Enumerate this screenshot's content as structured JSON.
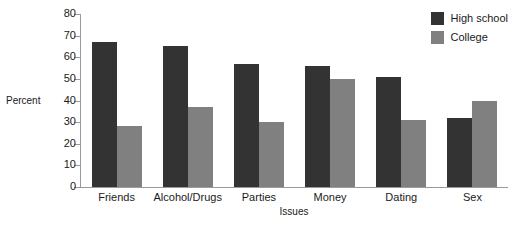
{
  "chart_data": {
    "type": "bar",
    "title": "",
    "xlabel": "Issues",
    "ylabel": "Percent",
    "categories": [
      "Friends",
      "Alcohol/Drugs",
      "Parties",
      "Money",
      "Dating",
      "Sex"
    ],
    "series": [
      {
        "name": "High school",
        "color": "#333333",
        "values": [
          67,
          65,
          57,
          56,
          51,
          32
        ]
      },
      {
        "name": "College",
        "color": "#808080",
        "values": [
          28,
          37,
          30,
          50,
          31,
          40
        ]
      }
    ],
    "ylim": [
      0,
      80
    ],
    "ytick_step": 10,
    "yticks": [
      80,
      70,
      60,
      50,
      40,
      30,
      20,
      10,
      0
    ],
    "grid": false,
    "legend_position": "top-right",
    "axis_color": "#9a9a9a",
    "background": "#ffffff"
  }
}
